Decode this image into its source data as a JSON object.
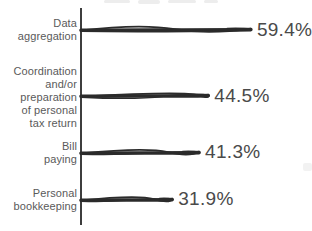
{
  "chart_data": {
    "type": "bar",
    "orientation": "horizontal",
    "style": "hand-drawn scribble strokes",
    "title": "",
    "xlabel": "",
    "ylabel": "",
    "xlim": [
      0,
      70
    ],
    "grid": false,
    "legend": null,
    "categories": [
      "Data aggregation",
      "Coordination and/or preparation of personal tax return",
      "Bill paying",
      "Personal bookkeeping"
    ],
    "values": [
      59.4,
      44.5,
      41.3,
      31.9
    ],
    "value_labels": [
      "59.4%",
      "44.5%",
      "41.3%",
      "31.9%"
    ],
    "label_lines": [
      "Data\naggregation",
      "Coordination\nand/or\npreparation\nof personal\ntax return",
      "Bill\npaying",
      "Personal\nbookkeeping"
    ],
    "colors": {
      "bar": "#2b2b2b",
      "axis": "#3d3d3d",
      "category_label": "#5a5a5a",
      "value_label": "#4a4a4a",
      "background": "#ffffff"
    }
  }
}
